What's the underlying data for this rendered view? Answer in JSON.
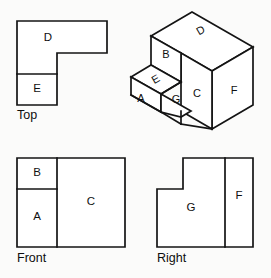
{
  "figure": {
    "background_color": "#fbfbfa",
    "line_color": "#141414",
    "face_color": "#ffffff"
  },
  "views": {
    "top": {
      "label": "Top",
      "label_pos": {
        "x": 17,
        "y": 119
      },
      "outline": "17,21 107,21 107,53 57,53 57,105 17,105",
      "internal_edges": [
        {
          "name": "d-e-divider",
          "d": "M17,74 L57,74"
        }
      ],
      "regions": [
        {
          "letter": "D",
          "x": 48,
          "y": 38
        },
        {
          "letter": "E",
          "x": 37,
          "y": 89
        }
      ]
    },
    "front": {
      "label": "Front",
      "label_pos": {
        "x": 17,
        "y": 262
      },
      "outline": "17,158 125,158 125,247 17,247",
      "internal_edges": [
        {
          "name": "ab-c-divider",
          "d": "M57,158 L57,247"
        },
        {
          "name": "b-a-divider",
          "d": "M17,189 L57,189"
        }
      ],
      "regions": [
        {
          "letter": "B",
          "x": 37,
          "y": 173
        },
        {
          "letter": "A",
          "x": 37,
          "y": 217
        },
        {
          "letter": "C",
          "x": 91,
          "y": 202
        }
      ]
    },
    "right": {
      "label": "Right",
      "label_pos": {
        "x": 157,
        "y": 262
      },
      "outline": "157,189 183,189 183,158 253,158 253,247 157,247",
      "internal_edges": [
        {
          "name": "g-f-divider",
          "d": "M225,158 L225,247"
        }
      ],
      "regions": [
        {
          "letter": "G",
          "x": 191,
          "y": 208
        },
        {
          "letter": "F",
          "x": 239,
          "y": 196
        }
      ]
    },
    "isometric": {
      "label": "",
      "faces": [
        {
          "name": "face-d-top-rear",
          "points": "192,12 253,47 212,71 151,36",
          "letter": "D",
          "letter_x": 201,
          "letter_y": 31,
          "letter_rotate": -30
        },
        {
          "name": "face-f-right-end",
          "points": "253,47 253,105 212,129 212,71",
          "letter": "F",
          "letter_x": 234,
          "letter_y": 91,
          "letter_rotate": 0
        },
        {
          "name": "face-c-front-tall",
          "points": "212,71 212,129 181,111 181,53",
          "letter": "C",
          "letter_x": 197,
          "letter_y": 94,
          "letter_rotate": 0
        },
        {
          "name": "face-b-front-step",
          "points": "151,36 181,53 181,82 151,65",
          "letter": "B",
          "letter_x": 166,
          "letter_y": 53,
          "letter_rotate": 0
        },
        {
          "name": "face-e-step-top",
          "points": "151,65 181,82 161,94 131,77",
          "letter": "E",
          "letter_x": 156,
          "letter_y": 79,
          "letter_rotate": -30
        },
        {
          "name": "face-a-front-low",
          "points": "131,77 161,94 161,112 131,95",
          "letter": "A",
          "letter_x": 140,
          "letter_y": 98,
          "letter_rotate": 0
        },
        {
          "name": "face-g-low-top",
          "points": "161,94 181,111 181,111 161,112",
          "letter": "G",
          "letter_x": 178,
          "letter_y": 86,
          "letter_rotate": 0
        }
      ],
      "letters": [
        "A",
        "B",
        "C",
        "D",
        "E",
        "F",
        "G"
      ]
    }
  }
}
